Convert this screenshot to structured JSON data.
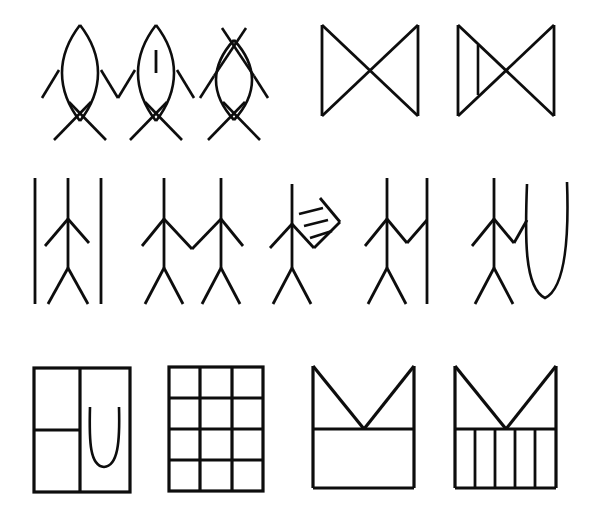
{
  "canvas": {
    "width": 609,
    "height": 519,
    "background": "#ffffff",
    "ink": "#0d0d0d",
    "title": "Pictographic line-drawing figure sheet"
  },
  "rows": [
    {
      "name": "row-1",
      "label": "Row 1 — lens-bodied figures and bowtie forms",
      "figures": [
        {
          "id": "fig-1-1",
          "name": "lens-figure-plain",
          "label": "Lens body with crossed arms and crossed legs"
        },
        {
          "id": "fig-1-2",
          "name": "lens-figure-with-tick",
          "label": "Lens body containing a vertical tick, crossed arms and legs"
        },
        {
          "id": "fig-1-3",
          "name": "lens-figure-double-cross",
          "label": "Lens body with crossed strokes above and below"
        },
        {
          "id": "fig-1-4",
          "name": "bowtie-plain",
          "label": "Bowtie: two triangles meeting at a centre point"
        },
        {
          "id": "fig-1-5",
          "name": "bowtie-with-bar",
          "label": "Bowtie with an extra vertical bar in the left triangle"
        }
      ]
    },
    {
      "name": "row-2",
      "label": "Row 2 — stick figures with attachments",
      "figures": [
        {
          "id": "fig-2-1",
          "name": "stick-figure-between-posts",
          "label": "Stick figure flanked by two vertical posts"
        },
        {
          "id": "fig-2-2",
          "name": "stick-figure-pair-joined",
          "label": "Two stick figures joined at the hands"
        },
        {
          "id": "fig-2-3",
          "name": "stick-figure-with-rake",
          "label": "Stick figure holding an angled three-tooth rake"
        },
        {
          "id": "fig-2-4",
          "name": "stick-figure-holding-post",
          "label": "Stick figure with arm linked to a vertical post"
        },
        {
          "id": "fig-2-5",
          "name": "stick-figure-with-u-hook",
          "label": "Stick figure with arm linked to a deep U hook"
        }
      ]
    },
    {
      "name": "row-3",
      "label": "Row 3 — rectangular enclosure forms",
      "figures": [
        {
          "id": "fig-3-1",
          "name": "enclosure-with-u",
          "label": "Rectangle split into panels with a U shape in the right panel"
        },
        {
          "id": "fig-3-2",
          "name": "grid-3x4",
          "label": "Rectangular grid of three columns by four rows"
        },
        {
          "id": "fig-3-3",
          "name": "notched-box-plain",
          "label": "Box with a V notch cut from the top, plain lower panel"
        },
        {
          "id": "fig-3-4",
          "name": "notched-box-striped",
          "label": "Box with a V notch cut from the top, striped lower panel"
        }
      ]
    }
  ],
  "counts": {
    "total_figures": 14,
    "row_1": 5,
    "row_2": 5,
    "row_3": 4
  },
  "stroke_widths": {
    "thin": 2.4,
    "medium": 3.0,
    "thick": 4.0
  }
}
